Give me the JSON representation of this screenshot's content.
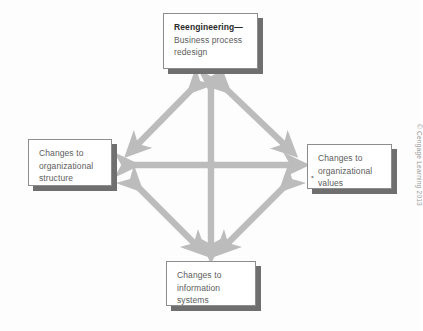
{
  "figure": {
    "credit": "© Cengage Learning 2013",
    "arrow_color": "#bcbcbc",
    "box_border_color": "#8d8d8d",
    "box_shadow_color": "#6f6f6f",
    "background_color": "#fdfdfd"
  },
  "nodes": {
    "top": {
      "name": "reengineering",
      "lines": [
        "Reengineering—",
        "Business process",
        "redesign"
      ]
    },
    "left": {
      "name": "organizational-structure",
      "lines": [
        "Changes to",
        "organizational",
        "structure"
      ]
    },
    "right": {
      "name": "organizational-values",
      "lines": [
        "Changes to",
        "organizational",
        "values"
      ],
      "bullet": "•"
    },
    "bottom": {
      "name": "information-systems",
      "lines": [
        "Changes to",
        "information",
        "systems"
      ]
    }
  },
  "connections": [
    {
      "from": "reengineering",
      "to": "organizational-structure",
      "style": "double-headed"
    },
    {
      "from": "reengineering",
      "to": "organizational-values",
      "style": "double-headed"
    },
    {
      "from": "organizational-structure",
      "to": "information-systems",
      "style": "double-headed"
    },
    {
      "from": "organizational-values",
      "to": "information-systems",
      "style": "double-headed"
    },
    {
      "from": "reengineering",
      "to": "information-systems",
      "style": "double-headed"
    },
    {
      "from": "organizational-structure",
      "to": "organizational-values",
      "style": "double-headed"
    }
  ]
}
